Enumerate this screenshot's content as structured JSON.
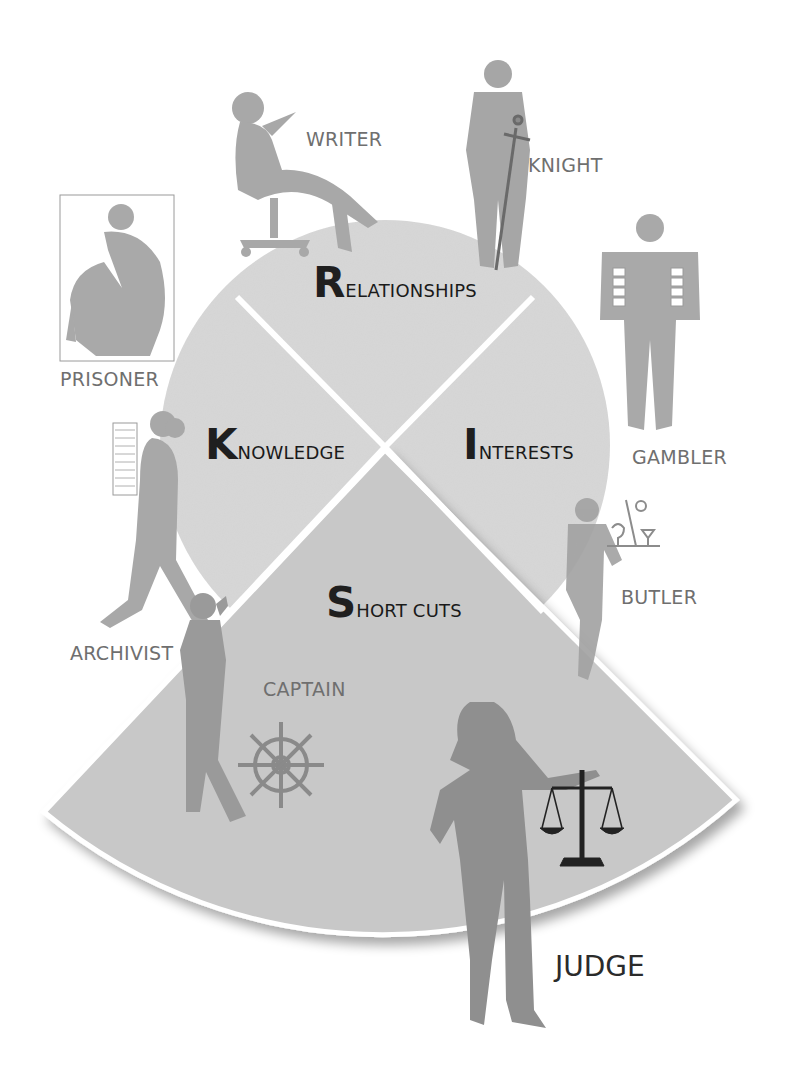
{
  "diagram": {
    "type": "segmented-circle-with-roles",
    "colors": {
      "background": "#ffffff",
      "circle_fill": "#d6d6d6",
      "wedge_fill": "#c9c9c9",
      "divider": "#ffffff",
      "silhouette_light": "#a9a9a9",
      "silhouette_dark": "#8c8c8c",
      "label_gray": "#6f6f6f",
      "title_dark": "#1f1f1f"
    },
    "sections": [
      {
        "id": "relationships",
        "initial": "R",
        "rest": "ELATIONSHIPS"
      },
      {
        "id": "knowledge",
        "initial": "K",
        "rest": "NOWLEDGE"
      },
      {
        "id": "interests",
        "initial": "I",
        "rest": "NTERESTS"
      },
      {
        "id": "short_cuts",
        "initial": "S",
        "rest": "HORT CUTS"
      }
    ],
    "roles": [
      {
        "id": "writer",
        "label": "WRITER",
        "section": "relationships"
      },
      {
        "id": "knight",
        "label": "KNIGHT",
        "section": "relationships"
      },
      {
        "id": "prisoner",
        "label": "PRISONER",
        "section": "knowledge"
      },
      {
        "id": "archivist",
        "label": "ARCHIVIST",
        "section": "knowledge"
      },
      {
        "id": "gambler",
        "label": "GAMBLER",
        "section": "interests"
      },
      {
        "id": "butler",
        "label": "BUTLER",
        "section": "interests"
      },
      {
        "id": "captain",
        "label": "CAPTAIN",
        "section": "short_cuts"
      },
      {
        "id": "judge",
        "label": "JUDGE",
        "section": "short_cuts"
      }
    ]
  }
}
